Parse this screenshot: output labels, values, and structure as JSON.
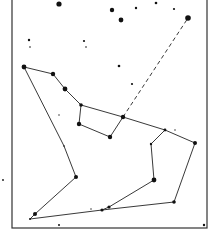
{
  "diagram": {
    "type": "constellation-map",
    "border": {
      "x1": 12,
      "y1": -2,
      "x2": 207,
      "y2": 228,
      "color": "#333333"
    },
    "stars": [
      {
        "x": 59,
        "y": 4,
        "r": 2.6
      },
      {
        "x": 112,
        "y": 10,
        "r": 2.2
      },
      {
        "x": 121,
        "y": 20,
        "r": 2.4
      },
      {
        "x": 136,
        "y": 8,
        "r": 1.2
      },
      {
        "x": 156,
        "y": 3,
        "r": 1.3
      },
      {
        "x": 174,
        "y": 9,
        "r": 1.1
      },
      {
        "x": 29,
        "y": 40,
        "r": 1.2
      },
      {
        "x": 30,
        "y": 47,
        "r": 0.8
      },
      {
        "x": 84,
        "y": 41,
        "r": 1.1
      },
      {
        "x": 86,
        "y": 47,
        "r": 0.8
      },
      {
        "x": 119,
        "y": 66,
        "r": 1.3
      },
      {
        "x": 132,
        "y": 84,
        "r": 1.1
      },
      {
        "x": 59,
        "y": 115,
        "r": 0.7
      },
      {
        "x": 3,
        "y": 180,
        "r": 0.9
      },
      {
        "x": 59,
        "y": 225,
        "r": 1.0
      },
      {
        "x": 204,
        "y": 225,
        "r": 1.2
      },
      {
        "x": 91,
        "y": 209,
        "r": 0.7
      },
      {
        "x": 175,
        "y": 130,
        "r": 0.7
      }
    ],
    "nodes": [
      {
        "id": "A",
        "x": 24,
        "y": 67,
        "r": 2.4
      },
      {
        "id": "B",
        "x": 53,
        "y": 74,
        "r": 2.2
      },
      {
        "id": "C",
        "x": 65,
        "y": 89,
        "r": 2.4
      },
      {
        "id": "D",
        "x": 81,
        "y": 105,
        "r": 1.8
      },
      {
        "id": "E",
        "x": 123,
        "y": 117,
        "r": 2.2
      },
      {
        "id": "F",
        "x": 165,
        "y": 130,
        "r": 1.4
      },
      {
        "id": "G",
        "x": 195,
        "y": 143,
        "r": 2.0
      },
      {
        "id": "H",
        "x": 79,
        "y": 124,
        "r": 2.2
      },
      {
        "id": "I",
        "x": 110,
        "y": 137,
        "r": 2.2
      },
      {
        "id": "J",
        "x": 188,
        "y": 18,
        "r": 2.8
      },
      {
        "id": "K",
        "x": 151,
        "y": 144,
        "r": 1.2
      },
      {
        "id": "L",
        "x": 154,
        "y": 180,
        "r": 2.4
      },
      {
        "id": "M",
        "x": 109,
        "y": 207,
        "r": 1.6
      },
      {
        "id": "N",
        "x": 102,
        "y": 210,
        "r": 1.6
      },
      {
        "id": "O",
        "x": 174,
        "y": 202,
        "r": 1.8
      },
      {
        "id": "P",
        "x": 64,
        "y": 146,
        "r": 0.8
      },
      {
        "id": "Q",
        "x": 76,
        "y": 177,
        "r": 2.0
      },
      {
        "id": "R",
        "x": 35,
        "y": 214,
        "r": 2.0
      },
      {
        "id": "S",
        "x": 30,
        "y": 219,
        "r": 1.0
      }
    ],
    "edges": [
      {
        "from": "A",
        "to": "B",
        "style": "solid"
      },
      {
        "from": "B",
        "to": "C",
        "style": "solid"
      },
      {
        "from": "C",
        "to": "D",
        "style": "solid"
      },
      {
        "from": "D",
        "to": "E",
        "style": "solid"
      },
      {
        "from": "E",
        "to": "F",
        "style": "solid"
      },
      {
        "from": "F",
        "to": "G",
        "style": "solid"
      },
      {
        "from": "D",
        "to": "H",
        "style": "solid"
      },
      {
        "from": "H",
        "to": "I",
        "style": "solid"
      },
      {
        "from": "I",
        "to": "E",
        "style": "solid"
      },
      {
        "from": "E",
        "to": "J",
        "style": "dashed"
      },
      {
        "from": "A",
        "to": "P",
        "style": "solid"
      },
      {
        "from": "P",
        "to": "Q",
        "style": "solid"
      },
      {
        "from": "Q",
        "to": "R",
        "style": "solid"
      },
      {
        "from": "R",
        "to": "S",
        "style": "solid"
      },
      {
        "from": "S",
        "to": "N",
        "style": "solid"
      },
      {
        "from": "N",
        "to": "O",
        "style": "solid"
      },
      {
        "from": "O",
        "to": "G",
        "style": "solid"
      },
      {
        "from": "F",
        "to": "K",
        "style": "solid"
      },
      {
        "from": "K",
        "to": "L",
        "style": "solid"
      },
      {
        "from": "L",
        "to": "M",
        "style": "solid"
      },
      {
        "from": "M",
        "to": "N",
        "style": "solid"
      }
    ],
    "line_color": "#222222",
    "star_color": "#111111"
  }
}
